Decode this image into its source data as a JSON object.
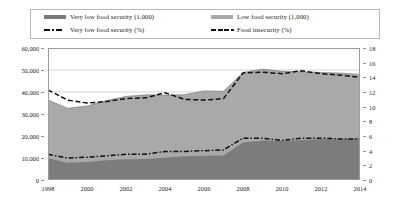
{
  "legend": {
    "items": [
      {
        "label": "Very low food security (1,000)",
        "marker": "area-swatch",
        "color": "#7c7c7c"
      },
      {
        "label": "Low food security (1,000)",
        "marker": "area-swatch",
        "color": "#a9a9a9"
      },
      {
        "label": "Very low food security (%)",
        "marker": "dash-dot-line",
        "color": "#111111"
      },
      {
        "label": "Food insecurity (%)",
        "marker": "dashed-line",
        "color": "#111111"
      }
    ]
  },
  "caption": "",
  "chart_data": {
    "type": "area",
    "title": "",
    "xlabel": "",
    "ylabel": "",
    "y2label": "",
    "grid": true,
    "legend_position": "top",
    "x": [
      1998,
      1999,
      2000,
      2001,
      2002,
      2003,
      2004,
      2005,
      2006,
      2007,
      2008,
      2009,
      2010,
      2011,
      2012,
      2013,
      2014
    ],
    "xtick_labels": [
      "1998",
      "2000",
      "2002",
      "2004",
      "2006",
      "2008",
      "2010",
      "2012",
      "2014"
    ],
    "xtick_values": [
      1998,
      2000,
      2002,
      2004,
      2006,
      2008,
      2010,
      2012,
      2014
    ],
    "ylim": [
      0,
      60000
    ],
    "ytick_labels": [
      "0",
      "10,000",
      "20,000",
      "30,000",
      "40,000",
      "50,000",
      "60,000"
    ],
    "ytick_values": [
      0,
      10000,
      20000,
      30000,
      40000,
      50000,
      60000
    ],
    "y2lim": [
      0,
      18
    ],
    "y2tick_labels": [
      "0",
      "2",
      "4",
      "6",
      "8",
      "10",
      "12",
      "14",
      "16",
      "18"
    ],
    "y2tick_values": [
      0,
      2,
      4,
      6,
      8,
      10,
      12,
      14,
      16,
      18
    ],
    "series": [
      {
        "name": "Very low food security (1,000)",
        "axis": "left",
        "type": "stacked-area",
        "stack_order": 1,
        "color": "#7c7c7c",
        "values": [
          9900,
          7800,
          8200,
          9000,
          9400,
          9600,
          10100,
          10800,
          11000,
          11100,
          17100,
          17900,
          17700,
          18200,
          18500,
          18500,
          19100
        ]
      },
      {
        "name": "Low food security (1,000)",
        "axis": "left",
        "type": "stacked-area",
        "stack_order": 2,
        "color": "#a9a9a9",
        "values": [
          26500,
          24800,
          25400,
          27100,
          28600,
          29100,
          28500,
          28000,
          29500,
          29200,
          31800,
          32500,
          31700,
          31000,
          30400,
          30100,
          28900
        ]
      },
      {
        "name": "Very low food security (%)",
        "axis": "right",
        "type": "line",
        "style": "dash-dot",
        "color": "#111111",
        "values": [
          3.5,
          3.0,
          3.1,
          3.3,
          3.5,
          3.5,
          3.9,
          3.9,
          4.0,
          4.1,
          5.7,
          5.7,
          5.4,
          5.7,
          5.7,
          5.6,
          5.6
        ]
      },
      {
        "name": "Food insecurity (%)",
        "axis": "right",
        "type": "line",
        "style": "dashed",
        "color": "#111111",
        "values": [
          12.3,
          10.9,
          10.5,
          10.7,
          11.1,
          11.2,
          11.9,
          11.0,
          10.9,
          11.1,
          14.6,
          14.7,
          14.5,
          14.9,
          14.5,
          14.3,
          14.0
        ]
      }
    ]
  }
}
